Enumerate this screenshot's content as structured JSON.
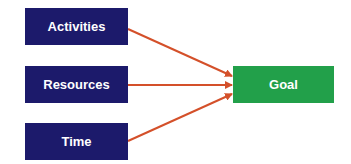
{
  "diagram": {
    "sources": [
      {
        "label": "Activities"
      },
      {
        "label": "Resources"
      },
      {
        "label": "Time"
      }
    ],
    "target": {
      "label": "Goal"
    },
    "colors": {
      "source_fill": "#1c1a6b",
      "target_fill": "#22a04a",
      "arrow": "#d4502a"
    }
  }
}
